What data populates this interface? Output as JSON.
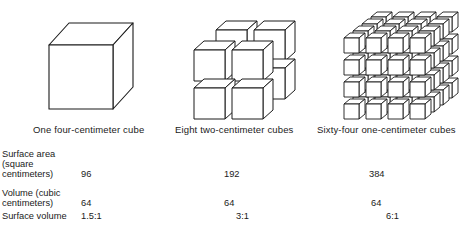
{
  "diagram": {
    "captions": [
      "One four-centimeter cube",
      "Eight two-centimeter cubes",
      "Sixty-four one-centimeter cubes"
    ],
    "rows": [
      {
        "label_lines": [
          "Surface area",
          "(square",
          "centimeters)"
        ],
        "values": [
          "96",
          "192",
          "384"
        ]
      },
      {
        "label_lines": [
          "Volume (cubic",
          "centimeters)"
        ],
        "values": [
          "64",
          "64",
          "64"
        ]
      },
      {
        "label_lines": [
          "Surface volume"
        ],
        "values": [
          "1.5:1",
          "3:1",
          "6:1"
        ]
      }
    ],
    "colors": {
      "stroke": "#1a1a1a",
      "face": "#ffffff"
    }
  }
}
